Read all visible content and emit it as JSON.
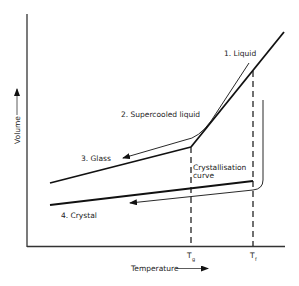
{
  "diagram": {
    "axes": {
      "y_label": "Volume",
      "x_label": "Temperature"
    },
    "labels": {
      "liquid": "1. Liquid",
      "supercooled": "2. Supercooled liquid",
      "glass": "3. Glass",
      "crystal": "4. Crystal",
      "crystallisation_line1": "Crystallisation",
      "crystallisation_line2": "curve"
    },
    "ticks": {
      "tg_main": "T",
      "tg_sub": "g",
      "tf_main": "T",
      "tf_sub": "f"
    },
    "colors": {
      "line": "#111111",
      "background": "#ffffff"
    }
  }
}
